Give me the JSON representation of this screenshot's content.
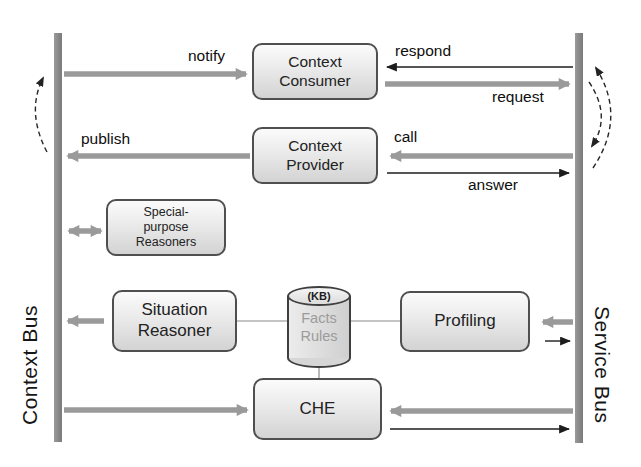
{
  "diagram": {
    "buses": {
      "context": {
        "label": "Context Bus"
      },
      "service": {
        "label": "Service Bus"
      }
    },
    "nodes": {
      "context_consumer": {
        "label": "Context\nConsumer"
      },
      "context_provider": {
        "label": "Context\nProvider"
      },
      "special_reasoners": {
        "label": "Special-\npurpose\nReasoners"
      },
      "situation_reasoner": {
        "label": "Situation\nReasoner"
      },
      "profiling": {
        "label": "Profiling"
      },
      "che": {
        "label": "CHE"
      },
      "knowledge_base": {
        "title": "(KB)",
        "content": "Facts\nRules"
      }
    },
    "edge_labels": {
      "notify": "notify",
      "publish": "publish",
      "respond": "respond",
      "request": "request",
      "call": "call",
      "answer": "answer"
    },
    "colors": {
      "background": "#ffffff",
      "bus": "#8e8e8e",
      "thick_arrow": "#9a9a9a",
      "thin_arrow": "#1c1c1c",
      "box_border": "#4f4f4f",
      "kb_text": "#9b9b9b"
    }
  }
}
